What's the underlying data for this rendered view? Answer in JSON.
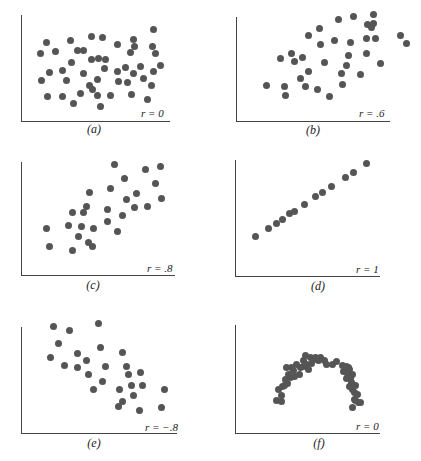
{
  "chart_data": [
    {
      "type": "scatter",
      "title": "",
      "caption": "(a)",
      "r_label": "r = 0",
      "r": 0,
      "xlabel": "",
      "ylabel": "",
      "grid": false,
      "axis": {
        "x0": 21,
        "y0": 121,
        "x1": 170,
        "ytop": 15
      },
      "points": [
        [
          40,
          53
        ],
        [
          46,
          42
        ],
        [
          55,
          51
        ],
        [
          70,
          40
        ],
        [
          77,
          50
        ],
        [
          83,
          50
        ],
        [
          91,
          36
        ],
        [
          102,
          37
        ],
        [
          117,
          44
        ],
        [
          133,
          39
        ],
        [
          134,
          46
        ],
        [
          130,
          52
        ],
        [
          153,
          29
        ],
        [
          152,
          46
        ],
        [
          155,
          53
        ],
        [
          160,
          65
        ],
        [
          41,
          80
        ],
        [
          49,
          72
        ],
        [
          62,
          70
        ],
        [
          66,
          80
        ],
        [
          71,
          62
        ],
        [
          83,
          73
        ],
        [
          91,
          59
        ],
        [
          98,
          58
        ],
        [
          105,
          59
        ],
        [
          104,
          68
        ],
        [
          97,
          79
        ],
        [
          89,
          85
        ],
        [
          92,
          89
        ],
        [
          97,
          95
        ],
        [
          117,
          71
        ],
        [
          118,
          81
        ],
        [
          125,
          67
        ],
        [
          127,
          82
        ],
        [
          133,
          73
        ],
        [
          140,
          66
        ],
        [
          143,
          78
        ],
        [
          153,
          71
        ],
        [
          151,
          85
        ],
        [
          47,
          96
        ],
        [
          62,
          96
        ],
        [
          80,
          93
        ],
        [
          73,
          103
        ],
        [
          100,
          106
        ],
        [
          110,
          95
        ],
        [
          131,
          94
        ],
        [
          147,
          99
        ]
      ]
    },
    {
      "type": "scatter",
      "title": "",
      "caption": "(b)",
      "r_label": "r = .6",
      "r": 0.6,
      "xlabel": "",
      "ylabel": "",
      "grid": false,
      "axis": {
        "x0": 236,
        "y0": 121,
        "x1": 390,
        "ytop": 17
      },
      "points": [
        [
          266,
          85
        ],
        [
          284,
          86
        ],
        [
          285,
          95
        ],
        [
          280,
          58
        ],
        [
          291,
          53
        ],
        [
          294,
          61
        ],
        [
          302,
          57
        ],
        [
          308,
          71
        ],
        [
          300,
          78
        ],
        [
          305,
          86
        ],
        [
          317,
          89
        ],
        [
          329,
          96
        ],
        [
          324,
          62
        ],
        [
          308,
          35
        ],
        [
          319,
          28
        ],
        [
          320,
          44
        ],
        [
          334,
          40
        ],
        [
          338,
          19
        ],
        [
          353,
          16
        ],
        [
          367,
          24
        ],
        [
          371,
          27
        ],
        [
          366,
          38
        ],
        [
          350,
          42
        ],
        [
          348,
          55
        ],
        [
          346,
          65
        ],
        [
          341,
          73
        ],
        [
          342,
          84
        ],
        [
          360,
          74
        ],
        [
          366,
          53
        ],
        [
          373,
          14
        ],
        [
          373,
          23
        ],
        [
          375,
          38
        ],
        [
          380,
          63
        ],
        [
          400,
          35
        ],
        [
          406,
          43
        ]
      ]
    },
    {
      "type": "scatter",
      "title": "",
      "caption": "(c)",
      "r_label": "r = .8",
      "r": 0.8,
      "xlabel": "",
      "ylabel": "",
      "grid": false,
      "axis": {
        "x0": 21,
        "y0": 275,
        "x1": 175,
        "ytop": 162
      },
      "points": [
        [
          46,
          228
        ],
        [
          49,
          246
        ],
        [
          72,
          212
        ],
        [
          68,
          225
        ],
        [
          72,
          250
        ],
        [
          78,
          236
        ],
        [
          81,
          226
        ],
        [
          83,
          212
        ],
        [
          86,
          206
        ],
        [
          89,
          192
        ],
        [
          88,
          242
        ],
        [
          92,
          246
        ],
        [
          93,
          228
        ],
        [
          107,
          209
        ],
        [
          107,
          221
        ],
        [
          110,
          188
        ],
        [
          114,
          164
        ],
        [
          117,
          231
        ],
        [
          122,
          215
        ],
        [
          124,
          178
        ],
        [
          126,
          199
        ],
        [
          134,
          207
        ],
        [
          136,
          193
        ],
        [
          147,
          206
        ],
        [
          145,
          169
        ],
        [
          155,
          183
        ],
        [
          160,
          166
        ],
        [
          161,
          198
        ]
      ]
    },
    {
      "type": "scatter",
      "title": "",
      "caption": "(d)",
      "r_label": "r = 1",
      "r": 1,
      "xlabel": "",
      "ylabel": "",
      "grid": false,
      "axis": {
        "x0": 235,
        "y0": 276,
        "x1": 380,
        "ytop": 160
      },
      "points": [
        [
          255,
          236
        ],
        [
          268,
          228
        ],
        [
          276,
          223
        ],
        [
          282,
          219
        ],
        [
          289,
          213
        ],
        [
          294,
          211
        ],
        [
          304,
          204
        ],
        [
          315,
          196
        ],
        [
          322,
          192
        ],
        [
          331,
          186
        ],
        [
          345,
          177
        ],
        [
          353,
          172
        ],
        [
          366,
          163
        ]
      ]
    },
    {
      "type": "scatter",
      "title": "",
      "caption": "(e)",
      "r_label": "r = −.8",
      "r": -0.8,
      "xlabel": "",
      "ylabel": "",
      "grid": false,
      "axis": {
        "x0": 21,
        "y0": 433,
        "x1": 177,
        "ytop": 327
      },
      "points": [
        [
          53,
          326
        ],
        [
          69,
          330
        ],
        [
          98,
          323
        ],
        [
          58,
          343
        ],
        [
          50,
          357
        ],
        [
          77,
          353
        ],
        [
          64,
          365
        ],
        [
          77,
          367
        ],
        [
          86,
          360
        ],
        [
          88,
          374
        ],
        [
          100,
          347
        ],
        [
          105,
          366
        ],
        [
          102,
          381
        ],
        [
          93,
          389
        ],
        [
          122,
          352
        ],
        [
          126,
          366
        ],
        [
          128,
          374
        ],
        [
          140,
          372
        ],
        [
          131,
          385
        ],
        [
          142,
          385
        ],
        [
          119,
          389
        ],
        [
          133,
          395
        ],
        [
          122,
          401
        ],
        [
          118,
          406
        ],
        [
          139,
          410
        ],
        [
          164,
          389
        ],
        [
          161,
          407
        ]
      ]
    },
    {
      "type": "scatter",
      "title": "",
      "caption": "(f)",
      "r_label": "r = 0",
      "r": 0,
      "xlabel": "",
      "ylabel": "",
      "grid": false,
      "axis": {
        "x0": 235,
        "y0": 433,
        "x1": 380,
        "ytop": 325
      },
      "points": [
        [
          276,
          400
        ],
        [
          281,
          395
        ],
        [
          278,
          389
        ],
        [
          282,
          386
        ],
        [
          284,
          385
        ],
        [
          285,
          379
        ],
        [
          287,
          383
        ],
        [
          281,
          401
        ],
        [
          290,
          377
        ],
        [
          294,
          376
        ],
        [
          288,
          374
        ],
        [
          299,
          374
        ],
        [
          286,
          367
        ],
        [
          291,
          367
        ],
        [
          296,
          364
        ],
        [
          300,
          367
        ],
        [
          293,
          370
        ],
        [
          303,
          366
        ],
        [
          303,
          360
        ],
        [
          306,
          364
        ],
        [
          311,
          363
        ],
        [
          308,
          369
        ],
        [
          313,
          359
        ],
        [
          318,
          360
        ],
        [
          310,
          357
        ],
        [
          305,
          355
        ],
        [
          315,
          357
        ],
        [
          320,
          357
        ],
        [
          324,
          360
        ],
        [
          326,
          364
        ],
        [
          332,
          364
        ],
        [
          336,
          361
        ],
        [
          342,
          365
        ],
        [
          346,
          366
        ],
        [
          348,
          367
        ],
        [
          343,
          371
        ],
        [
          347,
          373
        ],
        [
          349,
          369
        ],
        [
          346,
          378
        ],
        [
          350,
          378
        ],
        [
          352,
          374
        ],
        [
          351,
          382
        ],
        [
          349,
          386
        ],
        [
          355,
          385
        ],
        [
          352,
          389
        ],
        [
          354,
          392
        ],
        [
          354,
          399
        ],
        [
          357,
          394
        ],
        [
          358,
          402
        ],
        [
          352,
          407
        ],
        [
          355,
          400
        ],
        [
          360,
          402
        ]
      ]
    }
  ]
}
